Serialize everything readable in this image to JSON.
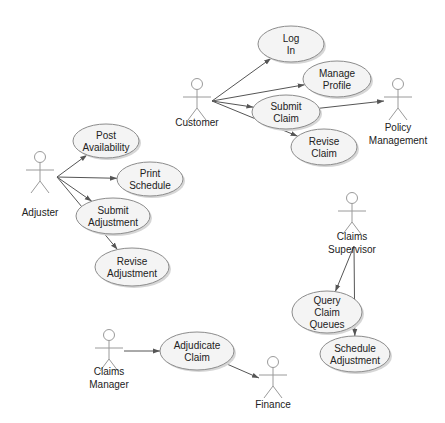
{
  "diagram": {
    "type": "uml-use-case",
    "actors": [
      {
        "id": "customer",
        "lines": [
          "Customer"
        ]
      },
      {
        "id": "policy-management",
        "lines": [
          "Policy",
          "Management"
        ]
      },
      {
        "id": "adjuster",
        "lines": [
          "Adjuster"
        ]
      },
      {
        "id": "claims-supervisor",
        "lines": [
          "Claims",
          "Supervisor"
        ]
      },
      {
        "id": "claims-manager",
        "lines": [
          "Claims",
          "Manager"
        ]
      },
      {
        "id": "finance",
        "lines": [
          "Finance"
        ]
      }
    ],
    "use_cases": [
      {
        "id": "log-in",
        "lines": [
          "Log",
          "In"
        ]
      },
      {
        "id": "manage-profile",
        "lines": [
          "Manage",
          "Profile"
        ]
      },
      {
        "id": "submit-claim",
        "lines": [
          "Submit",
          "Claim"
        ]
      },
      {
        "id": "revise-claim",
        "lines": [
          "Revise",
          "Claim"
        ]
      },
      {
        "id": "post-availability",
        "lines": [
          "Post",
          "Availability"
        ]
      },
      {
        "id": "print-schedule",
        "lines": [
          "Print",
          "Schedule"
        ]
      },
      {
        "id": "submit-adjustment",
        "lines": [
          "Submit",
          "Adjustment"
        ]
      },
      {
        "id": "revise-adjustment",
        "lines": [
          "Revise",
          "Adjustment"
        ]
      },
      {
        "id": "query-claim-queues",
        "lines": [
          "Query",
          "Claim",
          "Queues"
        ]
      },
      {
        "id": "schedule-adjustment",
        "lines": [
          "Schedule",
          "Adjustment"
        ]
      },
      {
        "id": "adjudicate-claim",
        "lines": [
          "Adjudicate",
          "Claim"
        ]
      }
    ],
    "associations": [
      {
        "from": "customer",
        "to": "log-in"
      },
      {
        "from": "customer",
        "to": "manage-profile"
      },
      {
        "from": "customer",
        "to": "submit-claim"
      },
      {
        "from": "customer",
        "to": "revise-claim"
      },
      {
        "from": "submit-claim",
        "to": "policy-management"
      },
      {
        "from": "adjuster",
        "to": "post-availability"
      },
      {
        "from": "adjuster",
        "to": "print-schedule"
      },
      {
        "from": "adjuster",
        "to": "submit-adjustment"
      },
      {
        "from": "adjuster",
        "to": "revise-adjustment"
      },
      {
        "from": "claims-supervisor",
        "to": "query-claim-queues"
      },
      {
        "from": "claims-supervisor",
        "to": "schedule-adjustment"
      },
      {
        "from": "claims-manager",
        "to": "adjudicate-claim"
      },
      {
        "from": "adjudicate-claim",
        "to": "finance"
      }
    ],
    "colors": {
      "use_case_fill": "#f4f4f4",
      "outline": "#8c8c8c",
      "line": "#555555",
      "text": "#222222"
    }
  }
}
